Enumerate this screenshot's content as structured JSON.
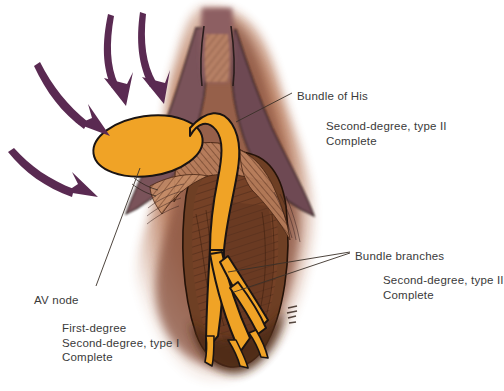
{
  "figure": {
    "type": "medical-illustration",
    "background_color": "#ffffff"
  },
  "colors": {
    "conduction_tissue": "#F0A326",
    "conduction_outline": "#1a1413",
    "arrow": "#5A2A52",
    "myocardium_dark": "#6B4A52",
    "myocardium_mid": "#8A5A4A",
    "myocardium_light": "#C98A6B",
    "septum_brown": "#7B4A2E",
    "hatching": "#C08A66",
    "leader_line": "#3a3028",
    "text": "#3a3a3a"
  },
  "labels": {
    "bundle_of_his": {
      "title": "Bundle of His",
      "conditions": [
        "Second-degree, type II",
        "Complete"
      ]
    },
    "bundle_branches": {
      "title": "Bundle branches",
      "conditions": [
        "Second-degree, type II",
        "Complete"
      ]
    },
    "av_node": {
      "title": "AV node",
      "conditions": [
        "First-degree",
        "Second-degree, type I",
        "Complete"
      ]
    }
  },
  "annotations": {
    "arrows": {
      "name": "impulse-arrows",
      "count": 4,
      "description": "Curved arrows converging on the AV node"
    },
    "signature": {
      "visible": true,
      "legible": false
    }
  }
}
